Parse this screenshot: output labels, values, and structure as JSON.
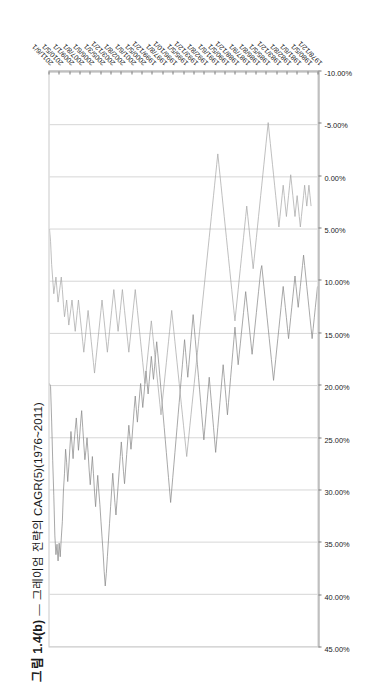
{
  "figure": {
    "number": "그림 1.4(b)",
    "dash": "—",
    "caption": "그레이엄 전략의 CAGR(5)(1976~2011)"
  },
  "legend": {
    "position": "top-left-inside",
    "items": [
      {
        "label": "그레이엄",
        "color": "#8a8a8a"
      },
      {
        "label": "S&P500",
        "color": "#a8a8a8"
      }
    ]
  },
  "chart_data": {
    "type": "line",
    "xlabel": "",
    "ylabel": "",
    "orientation": "rotated-90-ccw",
    "grid": true,
    "legend_position": "inside-top-left",
    "ylim": [
      -10,
      45
    ],
    "ytick_labels": [
      "45.00%",
      "40.00%",
      "35.00%",
      "30.00%",
      "25.00%",
      "20.00%",
      "15.00%",
      "10.00%",
      "5.00%",
      "0.00%",
      "-5.00%",
      "-10.00%"
    ],
    "ytick_values": [
      45,
      40,
      35,
      30,
      25,
      20,
      15,
      10,
      5,
      0,
      -5,
      -10
    ],
    "xtick_labels": [
      "2011/6/1",
      "2010/5/1",
      "2009/1/1",
      "2007/8/1",
      "2006/6/1",
      "2005/3/1",
      "2003/12/1",
      "2002/8/1",
      "2001/6/1",
      "2000/5/1",
      "1999/12/1",
      "1997/8/1",
      "1996/10/1",
      "1995/5/1",
      "1993/12/1",
      "1992/8/1",
      "1991/6/1",
      "1990/5/1",
      "1988/12/1",
      "1987/9/1",
      "1986/8/1",
      "1985/5/1",
      "1983/12/1",
      "1982/8/1",
      "1981/6/1",
      "1980/5/1",
      "1978/12/1"
    ],
    "x_range": [
      "1978/12/1",
      "2011/6/1"
    ],
    "series": [
      {
        "name": "그레이엄",
        "color": "#8a8a8a",
        "values": [
          19.8,
          20.1,
          23.4,
          27.2,
          30.5,
          34.4,
          36.2,
          35.2,
          36.8,
          35.1,
          36.4,
          34.6,
          33.0,
          30.1,
          28.4,
          26.1,
          27.4,
          29.2,
          27.8,
          26.0,
          24.4,
          25.6,
          27.0,
          25.4,
          24.2,
          23.1,
          24.6,
          26.2,
          25.0,
          23.6,
          22.4,
          24.0,
          25.6,
          27.1,
          26.2,
          25.0,
          26.4,
          28.1,
          29.5,
          28.2,
          26.8,
          28.4,
          30.2,
          31.6,
          30.0,
          28.6,
          30.1,
          31.4,
          33.0,
          34.5,
          36.0,
          37.8,
          39.2,
          38.0,
          36.4,
          34.8,
          33.2,
          31.6,
          30.0,
          28.4,
          29.8,
          31.2,
          32.4,
          31.0,
          29.6,
          28.2,
          26.8,
          25.4,
          26.8,
          28.2,
          29.4,
          28.0,
          26.6,
          25.2,
          23.8,
          24.9,
          26.1,
          25.0,
          23.6,
          22.2,
          21.0,
          22.3,
          23.5,
          22.2,
          21.0,
          19.8,
          20.9,
          22.1,
          21.0,
          19.8,
          18.6,
          19.7,
          20.8,
          19.6,
          18.4,
          17.2,
          18.3,
          19.4,
          18.2,
          17.0,
          15.8,
          16.9,
          18.0,
          19.2,
          20.4,
          21.6,
          22.8,
          24.0,
          25.2,
          26.4,
          27.6,
          28.8,
          30.0,
          31.2,
          30.0,
          28.8,
          27.6,
          26.4,
          25.2,
          24.0,
          22.8,
          21.6,
          20.4,
          19.2,
          18.0,
          16.8,
          15.6,
          16.8,
          18.0,
          19.2,
          18.0,
          16.8,
          15.6,
          14.4,
          13.2,
          14.4,
          15.6,
          16.8,
          18.0,
          19.2,
          20.4,
          21.6,
          22.8,
          24.0,
          25.2,
          24.0,
          22.8,
          21.6,
          20.4,
          19.2,
          20.4,
          21.6,
          22.8,
          24.0,
          25.2,
          26.4,
          25.2,
          24.0,
          22.8,
          21.6,
          20.4,
          19.2,
          18.0,
          19.2,
          20.4,
          21.6,
          22.8,
          21.6,
          20.4,
          19.2,
          18.0,
          16.8,
          15.6,
          14.4,
          15.6,
          16.8,
          18.0,
          17.0,
          16.0,
          15.0,
          14.0,
          13.0,
          12.0,
          11.0,
          12.0,
          13.0,
          14.0,
          15.0,
          16.0,
          17.0,
          16.0,
          15.0,
          14.0,
          13.0,
          12.0,
          11.0,
          10.0,
          9.0,
          8.5,
          9.5,
          10.5,
          11.5,
          12.5,
          13.5,
          14.5,
          15.5,
          16.5,
          17.5,
          18.5,
          19.5,
          18.5,
          17.5,
          16.5,
          15.5,
          14.5,
          13.5,
          12.5,
          11.5,
          10.5,
          11.5,
          12.5,
          13.5,
          14.5,
          15.5,
          14.5,
          13.5,
          12.5,
          11.5,
          10.5,
          9.5,
          10.5,
          11.5,
          12.5,
          11.5,
          10.5,
          9.5,
          8.5,
          7.5,
          8.5,
          9.5,
          10.5,
          11.5,
          12.5,
          13.5,
          14.5,
          15.5,
          14.5,
          13.5,
          12.5,
          11.5,
          10.5
        ]
      },
      {
        "name": "S&P500",
        "color": "#a8a8a8",
        "values": [
          5.0,
          6.2,
          8.4,
          9.8,
          11.2,
          10.4,
          9.6,
          10.8,
          12.0,
          11.2,
          10.4,
          9.6,
          10.8,
          12.2,
          13.4,
          12.6,
          11.8,
          13.0,
          14.2,
          13.4,
          12.6,
          11.8,
          12.8,
          13.8,
          14.8,
          13.8,
          12.8,
          11.8,
          12.8,
          13.8,
          14.8,
          15.8,
          16.8,
          15.8,
          14.8,
          13.8,
          12.8,
          13.8,
          14.8,
          15.8,
          16.8,
          17.8,
          18.8,
          17.8,
          16.8,
          15.8,
          14.8,
          13.8,
          12.8,
          11.8,
          12.8,
          13.8,
          14.8,
          15.8,
          16.8,
          15.8,
          14.8,
          13.8,
          12.8,
          11.8,
          10.8,
          11.8,
          12.8,
          13.8,
          14.8,
          13.8,
          12.8,
          11.8,
          10.8,
          11.8,
          12.8,
          13.8,
          14.8,
          15.8,
          16.8,
          15.8,
          14.8,
          13.8,
          12.8,
          11.8,
          10.8,
          11.8,
          12.8,
          13.8,
          14.8,
          15.8,
          16.8,
          17.8,
          18.8,
          19.8,
          18.8,
          17.8,
          16.8,
          15.8,
          14.8,
          13.8,
          14.8,
          15.8,
          16.8,
          17.8,
          18.8,
          19.8,
          20.8,
          21.8,
          22.8,
          21.8,
          20.8,
          19.8,
          18.8,
          17.8,
          16.8,
          15.8,
          14.8,
          13.8,
          12.8,
          13.8,
          14.8,
          15.8,
          16.8,
          17.8,
          18.8,
          19.8,
          20.8,
          21.8,
          22.8,
          23.8,
          24.8,
          25.8,
          26.8,
          25.8,
          24.8,
          23.8,
          22.8,
          21.8,
          20.8,
          19.8,
          18.8,
          17.8,
          16.8,
          15.8,
          14.8,
          13.8,
          12.8,
          11.8,
          10.8,
          9.8,
          8.8,
          7.8,
          6.8,
          5.8,
          4.8,
          3.8,
          2.8,
          1.8,
          0.8,
          -0.2,
          -1.2,
          -2.2,
          -1.2,
          -0.2,
          0.8,
          1.8,
          2.8,
          3.8,
          4.8,
          5.8,
          6.8,
          7.8,
          8.8,
          9.8,
          10.8,
          11.8,
          12.8,
          13.8,
          12.8,
          11.8,
          10.8,
          9.8,
          8.8,
          7.8,
          6.8,
          5.8,
          4.8,
          3.8,
          2.8,
          3.8,
          4.8,
          5.8,
          6.8,
          7.8,
          8.8,
          7.8,
          6.8,
          5.8,
          4.8,
          3.8,
          2.8,
          1.8,
          0.8,
          -0.2,
          -1.2,
          -2.2,
          -3.2,
          -4.2,
          -5.2,
          -4.2,
          -3.2,
          -2.2,
          -1.2,
          -0.2,
          0.8,
          1.8,
          2.8,
          3.8,
          4.8,
          3.8,
          2.8,
          1.8,
          0.8,
          1.8,
          2.8,
          3.8,
          2.8,
          1.8,
          0.8,
          -0.2,
          0.8,
          1.8,
          2.8,
          3.8,
          2.8,
          1.8,
          2.8,
          3.8,
          4.8,
          3.8,
          2.8,
          1.8,
          0.8,
          1.8,
          2.8,
          1.8,
          0.8,
          1.8,
          2.8
        ]
      }
    ]
  }
}
